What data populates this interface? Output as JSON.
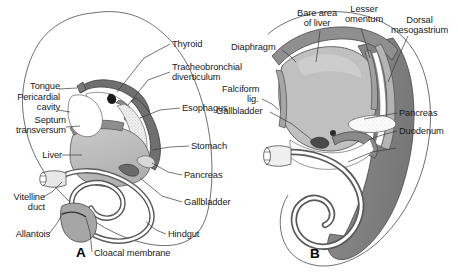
{
  "figure": {
    "panels": [
      {
        "letter": "A",
        "caption": "Midsagittal section of early embryo showing primitive gut tube"
      },
      {
        "letter": "B",
        "caption": "Later stage showing liver, stomach and mesenteries"
      }
    ]
  },
  "colors": {
    "outline": "#3a3a3a",
    "gut_wall_dark": "#6e6e6e",
    "gut_wall_mid": "#9a9a9a",
    "organ_fill": "#b9b9b9",
    "organ_fill_light": "#d4d4d4",
    "lumen": "#ffffff",
    "stipple": "#dedede",
    "label_text": "#1a1a1a",
    "background": "#ffffff"
  },
  "panelA": {
    "letter": "A",
    "labels_left": [
      {
        "id": "tongue",
        "text": "Tongue",
        "x": 25,
        "y": 86
      },
      {
        "id": "pericardial-cavity",
        "text": "Pericardial\ncavity",
        "x": 12,
        "y": 97
      },
      {
        "id": "septum-transversum",
        "text": "Septum\ntransversum",
        "x": 13,
        "y": 120
      },
      {
        "id": "liver",
        "text": "Liver",
        "x": 41,
        "y": 152
      },
      {
        "id": "vitelline-duct",
        "text": "Vitelline\nduct",
        "x": 14,
        "y": 196
      },
      {
        "id": "allantois",
        "text": "Allantois",
        "x": 14,
        "y": 237
      },
      {
        "id": "cloacal-membrane",
        "text": "Cloacal membrane",
        "x": 96,
        "y": 255
      }
    ],
    "labels_right": [
      {
        "id": "thyroid",
        "text": "Thyroid",
        "x": 172,
        "y": 41
      },
      {
        "id": "tracheobronchial-diverticulum",
        "text": "Tracheobronchial\ndiverticulum",
        "x": 172,
        "y": 66
      },
      {
        "id": "esophagus",
        "text": "Esophagus",
        "x": 182,
        "y": 105
      },
      {
        "id": "stomach",
        "text": "Stomach",
        "x": 191,
        "y": 143
      },
      {
        "id": "pancreas",
        "text": "Pancreas",
        "x": 184,
        "y": 172
      },
      {
        "id": "gallbladder",
        "text": "Gallbladder",
        "x": 184,
        "y": 199
      },
      {
        "id": "hindgut",
        "text": "Hindgut",
        "x": 168,
        "y": 231
      }
    ]
  },
  "panelB": {
    "letter": "B",
    "labels_top": [
      {
        "id": "bare-area-of-liver",
        "text": "Bare area\nof liver",
        "x": 296,
        "y": 10
      },
      {
        "id": "lesser-omentum",
        "text": "Lesser\nomentum",
        "x": 345,
        "y": 6
      },
      {
        "id": "dorsal-mesogastrium",
        "text": "Dorsal\nmesogastrium",
        "x": 383,
        "y": 17
      }
    ],
    "labels_left": [
      {
        "id": "diaphragm",
        "text": "Diaphragm",
        "x": 238,
        "y": 44
      },
      {
        "id": "falciform-lig",
        "text": "Falciform",
        "x": 225,
        "y": 86
      },
      {
        "id": "falciform-lig-second",
        "text": "lig.",
        "x": 249,
        "y": 96
      },
      {
        "id": "gallbladder-b",
        "text": "Gallbladder",
        "x": 219,
        "y": 109
      }
    ],
    "labels_right": [
      {
        "id": "pancreas-b",
        "text": "Pancreas",
        "x": 399,
        "y": 110
      },
      {
        "id": "duodenum",
        "text": "Duodenum",
        "x": 399,
        "y": 128
      }
    ]
  }
}
